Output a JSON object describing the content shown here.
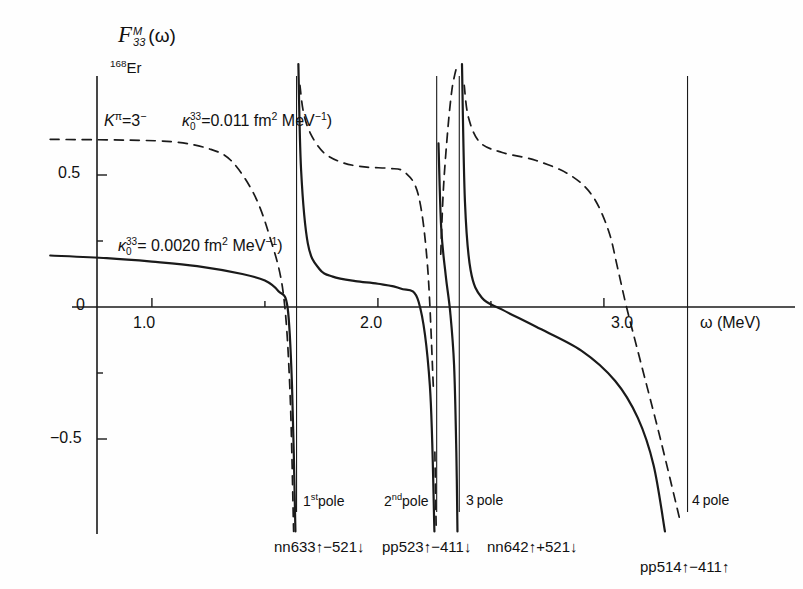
{
  "figure": {
    "title": "F",
    "title_sup": "M",
    "title_sub": "33",
    "title_arg": "(ω)",
    "isotope_mass": "168",
    "isotope_symbol": "Er",
    "quantum_numbers": "K",
    "quantum_numbers_sup": "π",
    "quantum_numbers_val": "=3",
    "quantum_numbers_parity": "−"
  },
  "curves": {
    "dashed": {
      "kappa_symbol": "κ",
      "kappa_sub": "0",
      "kappa_sup": "33",
      "kappa_eq": "=0.011 fm",
      "kappa_unit_sup": "2",
      "kappa_unit": " MeV",
      "kappa_unit_exp": "−1",
      "kappa_tail": ")",
      "style": "dashed",
      "color": "#1a1a1a",
      "value": 0.011,
      "unit": "fm^2 MeV^-1"
    },
    "solid": {
      "kappa_symbol": "κ",
      "kappa_sub": "0",
      "kappa_sup": "33",
      "kappa_eq": "= 0.0020  fm",
      "kappa_unit_sup": "2",
      "kappa_unit": " MeV",
      "kappa_unit_exp": "−1",
      "kappa_tail": ")",
      "style": "solid",
      "color": "#1a1a1a",
      "value": 0.002,
      "unit": "fm^2 MeV^-1"
    }
  },
  "axes": {
    "x_label": "ω  (MeV)",
    "x_ticks": [
      {
        "value": 1.0,
        "label": "1.0"
      },
      {
        "value": 1.5,
        "label": ""
      },
      {
        "value": 2.0,
        "label": "2.0"
      },
      {
        "value": 2.5,
        "label": ""
      },
      {
        "value": 3.0,
        "label": "3.0"
      }
    ],
    "y_ticks": [
      {
        "value": 0.5,
        "label": "0.5"
      },
      {
        "value": 0.25,
        "label": ""
      },
      {
        "value": 0.0,
        "label": "0"
      },
      {
        "value": -0.25,
        "label": ""
      },
      {
        "value": -0.5,
        "label": "−0.5"
      }
    ],
    "x_range": [
      0.55,
      3.45
    ],
    "y_range": [
      -0.85,
      0.92
    ]
  },
  "poles": [
    {
      "id": 1,
      "label": "1",
      "label_sup": "st",
      "label_rest": "pole",
      "omega": 1.64,
      "configuration": "nn633↑−521↓"
    },
    {
      "id": 2,
      "label": "2",
      "label_sup": "nd",
      "label_rest": "pole",
      "omega": 2.26,
      "configuration": "pp523↑−411↓"
    },
    {
      "id": 3,
      "label": "3",
      "label_sup": "",
      "label_rest": "pole",
      "omega": 2.36,
      "configuration": "nn642↑+521↓"
    },
    {
      "id": 4,
      "label": "4",
      "label_sup": "",
      "label_rest": "pole",
      "omega": 3.37,
      "configuration": "pp514↑−411↑"
    }
  ],
  "chart_data": {
    "type": "line",
    "xlabel": "ω (MeV)",
    "ylabel": "F^M_33(ω)",
    "xlim": [
      0.55,
      3.45
    ],
    "ylim": [
      -0.85,
      0.92
    ],
    "grid": false,
    "legend": "inline-annotations",
    "poles_omega": [
      1.64,
      2.26,
      2.36,
      3.37
    ],
    "series": [
      {
        "name": "kappa_0^33 = 0.0020 fm^2 MeV^-1",
        "style": "solid",
        "branches": [
          {
            "x": [
              0.55,
              0.8,
              1.0,
              1.2,
              1.4,
              1.5,
              1.56,
              1.6,
              1.62,
              1.635
            ],
            "y": [
              0.195,
              0.185,
              0.172,
              0.155,
              0.125,
              0.1,
              0.06,
              0.0,
              -0.3,
              -0.85
            ]
          },
          {
            "x": [
              1.648,
              1.66,
              1.69,
              1.74,
              1.8,
              1.9,
              2.0,
              2.1,
              2.18,
              2.23,
              2.25
            ],
            "y": [
              0.92,
              0.52,
              0.24,
              0.145,
              0.115,
              0.098,
              0.088,
              0.07,
              0.02,
              -0.3,
              -0.85
            ]
          },
          {
            "x": [
              2.268,
              2.28,
              2.3,
              2.32,
              2.337,
              2.347,
              2.352
            ],
            "y": [
              0.62,
              0.3,
              0.12,
              -0.02,
              -0.22,
              -0.55,
              -0.85
            ]
          },
          {
            "x": [
              2.372,
              2.385,
              2.41,
              2.46,
              2.55,
              2.7,
              2.9,
              3.05,
              3.15,
              3.22,
              3.27
            ],
            "y": [
              0.92,
              0.4,
              0.14,
              0.035,
              -0.01,
              -0.075,
              -0.165,
              -0.28,
              -0.42,
              -0.6,
              -0.85
            ]
          }
        ]
      },
      {
        "name": "kappa_0^33 = 0.011 fm^2 MeV^-1",
        "style": "dashed",
        "branches": [
          {
            "x": [
              0.55,
              0.9,
              1.1,
              1.25,
              1.35,
              1.45,
              1.52,
              1.58,
              1.61,
              1.627
            ],
            "y": [
              0.635,
              0.632,
              0.625,
              0.6,
              0.555,
              0.43,
              0.27,
              0.06,
              -0.3,
              -0.85
            ]
          },
          {
            "x": [
              1.655,
              1.67,
              1.7,
              1.76,
              1.85,
              1.95,
              2.05,
              2.12,
              2.18,
              2.22,
              2.245
            ],
            "y": [
              0.84,
              0.74,
              0.66,
              0.585,
              0.545,
              0.53,
              0.525,
              0.51,
              0.42,
              0.15,
              -0.3
            ]
          },
          {
            "x": [
              2.252,
              2.258
            ],
            "y": [
              -0.55,
              -0.85
            ]
          },
          {
            "x": [
              2.278,
              2.29,
              2.31,
              2.327,
              2.34,
              2.352
            ],
            "y": [
              0.2,
              0.45,
              0.68,
              0.82,
              0.88,
              0.92
            ]
          },
          {
            "x": [
              2.382,
              2.4,
              2.45,
              2.55,
              2.7,
              2.85,
              2.95,
              3.02,
              3.06,
              3.1,
              3.16,
              3.25,
              3.34
            ],
            "y": [
              0.84,
              0.72,
              0.625,
              0.585,
              0.555,
              0.5,
              0.42,
              0.29,
              0.15,
              0.0,
              -0.2,
              -0.5,
              -0.82
            ]
          }
        ]
      }
    ]
  }
}
